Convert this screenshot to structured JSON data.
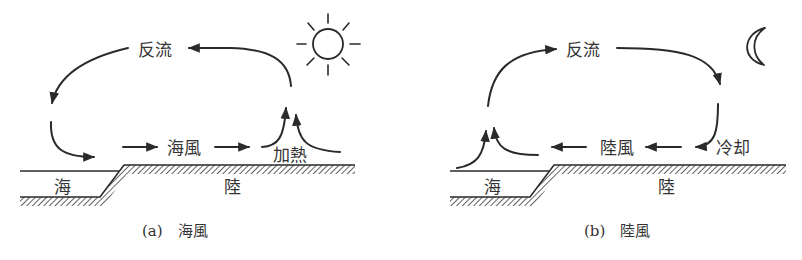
{
  "figure": {
    "panels": [
      {
        "id": "a",
        "caption": "(a)　海風",
        "labels": {
          "return_flow": "反流",
          "wind": "海風",
          "process": "加熱",
          "sea": "海",
          "land": "陸"
        },
        "icon": "sun-icon"
      },
      {
        "id": "b",
        "caption": "(b)　陸風",
        "labels": {
          "return_flow": "反流",
          "wind": "陸風",
          "process": "冷却",
          "sea": "海",
          "land": "陸"
        },
        "icon": "moon-icon"
      }
    ]
  },
  "colors": {
    "ink": "#2a2a2a",
    "text": "#333333",
    "background": "#ffffff"
  }
}
